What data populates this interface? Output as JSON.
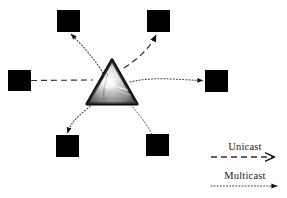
{
  "figure": {
    "type": "network-diagram",
    "background_color": "#ffffff",
    "node_color": "#000000",
    "line_color": "#3a3a3a"
  },
  "center": {
    "name": "prism-triangle",
    "shape": "triangle",
    "apex": {
      "x": 112,
      "y": 61
    },
    "left": {
      "x": 88,
      "y": 103
    },
    "right": {
      "x": 136,
      "y": 103
    },
    "border_color": "#0d0d0d",
    "fill_highlight": "#f2f2f2",
    "fill_mid": "#9a9a9a",
    "fill_shadow": "#4a4a4a"
  },
  "nodes": [
    {
      "id": "node-top-left",
      "x": 57,
      "y": 10,
      "w": 23,
      "h": 22
    },
    {
      "id": "node-top-right",
      "x": 147,
      "y": 10,
      "w": 23,
      "h": 22
    },
    {
      "id": "node-left",
      "x": 8,
      "y": 70,
      "w": 23,
      "h": 21
    },
    {
      "id": "node-right",
      "x": 205,
      "y": 70,
      "w": 23,
      "h": 22
    },
    {
      "id": "node-bottom-left",
      "x": 56,
      "y": 135,
      "w": 23,
      "h": 22
    },
    {
      "id": "node-bottom-right",
      "x": 146,
      "y": 134,
      "w": 23,
      "h": 22
    }
  ],
  "links": [
    {
      "id": "link-left-to-center",
      "style": "dashed",
      "arrow": false,
      "traffic": "Unicast"
    },
    {
      "id": "link-center-to-top-right",
      "style": "dashed",
      "arrow": true,
      "traffic": "Unicast"
    },
    {
      "id": "link-center-to-top-left",
      "style": "dotted",
      "arrow": true,
      "traffic": "Multicast"
    },
    {
      "id": "link-center-to-right",
      "style": "dotted",
      "arrow": true,
      "traffic": "Multicast"
    },
    {
      "id": "link-center-to-bottom-left",
      "style": "dotted",
      "arrow": true,
      "traffic": "Multicast"
    },
    {
      "id": "link-bottom-right-to-center",
      "style": "dotted",
      "arrow": false,
      "traffic": "Multicast"
    }
  ],
  "legend": {
    "items": [
      {
        "id": "legend-unicast",
        "label": "Unicast",
        "style": "dashed",
        "arrowhead": "open",
        "label_x": 245,
        "label_y": 150,
        "line_y": 157,
        "line_x1": 211,
        "line_x2": 276
      },
      {
        "id": "legend-multicast",
        "label": "Multicast",
        "style": "dotted",
        "arrowhead": "solid",
        "label_x": 245,
        "label_y": 179,
        "line_y": 186,
        "line_x1": 211,
        "line_x2": 278
      }
    ]
  }
}
